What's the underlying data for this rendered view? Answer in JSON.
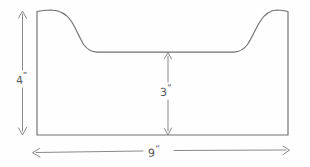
{
  "diagram": {
    "kind": "engineering-sketch",
    "style": "hand-drawn pencil line sketch",
    "background_color": "#fefefe",
    "line_color": "#6f6f6f",
    "dimension_line_color": "#8a8a8a",
    "label_color": "#555555"
  },
  "labels": {
    "outer_height": "4",
    "inner_height": "3",
    "width": "9",
    "unit_mark": "”"
  },
  "dimensions": [
    {
      "name": "outer-height",
      "value": "4",
      "unit": "inches",
      "display": "4”",
      "orientation": "vertical",
      "position": "left of shape",
      "arrowheads": "both-ends"
    },
    {
      "name": "inner-height",
      "value": "3",
      "unit": "inches",
      "display": "3”",
      "orientation": "vertical",
      "position": "center of shape",
      "arrowheads": "both-ends"
    },
    {
      "name": "overall-width",
      "value": "9",
      "unit": "inches",
      "display": "9”",
      "orientation": "horizontal",
      "position": "below shape",
      "arrowheads": "both-ends"
    }
  ],
  "geometry": {
    "shape_left_x": 37,
    "shape_right_x": 288,
    "shape_top_y": 10,
    "shape_bottom_y": 135,
    "inner_floor_y": 52,
    "left_curve_start_x": 50,
    "left_curve_end_x": 90,
    "right_curve_start_x": 236,
    "right_curve_end_x": 276,
    "profile_path": "M 37 135 L 37 11 L 50 10 C 66 11 72 18 78 33 C 83 46 88 51 96 52 L 236 52 C 245 51 250 45 255 32 C 261 17 267 10 277 10 L 288 11 L 288 135 Z"
  }
}
